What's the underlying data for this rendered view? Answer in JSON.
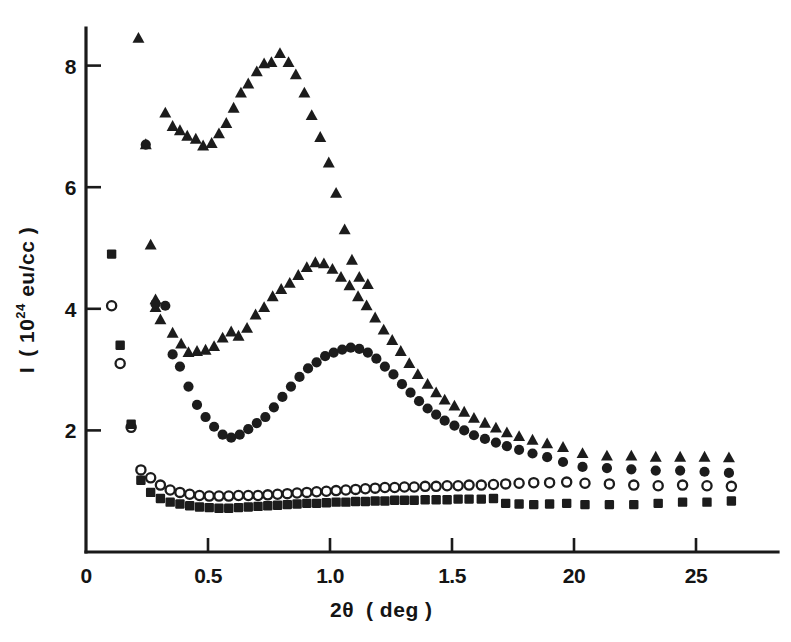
{
  "figure": {
    "background_color": "#ffffff",
    "ink_color": "#1c1c1c",
    "width": 791,
    "height": 642
  },
  "axes": {
    "x_title_main": "2",
    "x_title_theta": "θ",
    "x_title_unit": "( deg )",
    "y_title_symbol": "I",
    "y_title_open": "( 10",
    "y_title_exponent": "24",
    "y_title_rest": " eu/cc )",
    "x_ticks": [
      "0",
      "0.5",
      "1.0",
      "1.5",
      "20",
      "25"
    ],
    "x_tick_values": [
      0,
      0.5,
      1.0,
      1.5,
      2.0,
      2.5
    ],
    "y_ticks": [
      "2",
      "4",
      "6",
      "8"
    ],
    "y_tick_values": [
      2,
      4,
      6,
      8
    ]
  },
  "chart_data": {
    "type": "scatter",
    "title": "",
    "xlabel": "2θ ( deg )",
    "ylabel": "I ( 10^24 eu/cc )",
    "xlim": [
      0,
      2.75
    ],
    "ylim": [
      0,
      8.8
    ],
    "grid": false,
    "legend": "none",
    "x_tick_labels": [
      "0",
      "0.5",
      "1.0",
      "1.5",
      "20",
      "25"
    ],
    "y_tick_labels": [
      "2",
      "4",
      "6",
      "8"
    ],
    "series": [
      {
        "name": "triangle-series",
        "marker": "filled-triangle",
        "color": "#1c1c1c",
        "points": [
          [
            0.215,
            8.45
          ],
          [
            0.245,
            6.7
          ],
          [
            0.265,
            5.05
          ],
          [
            0.285,
            4.15
          ],
          [
            0.285,
            4.02
          ],
          [
            0.305,
            3.82
          ],
          [
            0.325,
            7.22
          ],
          [
            0.355,
            7.0
          ],
          [
            0.385,
            6.93
          ],
          [
            0.415,
            6.84
          ],
          [
            0.45,
            6.79
          ],
          [
            0.48,
            6.68
          ],
          [
            0.515,
            6.72
          ],
          [
            0.545,
            6.88
          ],
          [
            0.575,
            7.05
          ],
          [
            0.605,
            7.3
          ],
          [
            0.635,
            7.55
          ],
          [
            0.665,
            7.7
          ],
          [
            0.7,
            7.9
          ],
          [
            0.73,
            8.03
          ],
          [
            0.76,
            8.05
          ],
          [
            0.795,
            8.2
          ],
          [
            0.83,
            8.05
          ],
          [
            0.86,
            7.85
          ],
          [
            0.895,
            7.55
          ],
          [
            0.925,
            7.18
          ],
          [
            0.96,
            6.82
          ],
          [
            0.995,
            6.4
          ],
          [
            1.025,
            5.9
          ],
          [
            1.06,
            5.3
          ],
          [
            1.09,
            4.8
          ],
          [
            1.12,
            4.52
          ],
          [
            1.155,
            4.4
          ],
          [
            0.355,
            3.6
          ],
          [
            0.39,
            3.42
          ],
          [
            0.42,
            3.28
          ],
          [
            0.455,
            3.3
          ],
          [
            0.49,
            3.32
          ],
          [
            0.525,
            3.38
          ],
          [
            0.56,
            3.52
          ],
          [
            0.595,
            3.62
          ],
          [
            0.625,
            3.55
          ],
          [
            0.66,
            3.68
          ],
          [
            0.695,
            3.9
          ],
          [
            0.73,
            4.02
          ],
          [
            0.765,
            4.2
          ],
          [
            0.8,
            4.32
          ],
          [
            0.835,
            4.42
          ],
          [
            0.87,
            4.55
          ],
          [
            0.905,
            4.68
          ],
          [
            0.94,
            4.76
          ],
          [
            0.975,
            4.74
          ],
          [
            1.01,
            4.65
          ],
          [
            1.045,
            4.52
          ],
          [
            1.08,
            4.38
          ],
          [
            1.115,
            4.2
          ],
          [
            1.15,
            4.05
          ],
          [
            1.185,
            3.85
          ],
          [
            1.22,
            3.65
          ],
          [
            1.255,
            3.48
          ],
          [
            1.29,
            3.3
          ],
          [
            1.325,
            3.1
          ],
          [
            1.36,
            2.92
          ],
          [
            1.4,
            2.76
          ],
          [
            1.435,
            2.62
          ],
          [
            1.47,
            2.5
          ],
          [
            1.51,
            2.4
          ],
          [
            1.55,
            2.3
          ],
          [
            1.59,
            2.2
          ],
          [
            1.635,
            2.12
          ],
          [
            1.68,
            2.04
          ],
          [
            1.725,
            1.96
          ],
          [
            1.775,
            1.9
          ],
          [
            1.83,
            1.84
          ],
          [
            1.89,
            1.78
          ],
          [
            1.955,
            1.72
          ],
          [
            2.035,
            1.62
          ],
          [
            2.135,
            1.58
          ],
          [
            2.235,
            1.58
          ],
          [
            2.335,
            1.56
          ],
          [
            2.435,
            1.56
          ],
          [
            2.535,
            1.56
          ],
          [
            2.635,
            1.55
          ]
        ]
      },
      {
        "name": "filled-circle-series",
        "marker": "filled-circle",
        "color": "#1c1c1c",
        "points": [
          [
            0.245,
            6.7
          ],
          [
            0.285,
            4.08
          ],
          [
            0.325,
            4.05
          ],
          [
            0.355,
            3.25
          ],
          [
            0.385,
            3.05
          ],
          [
            0.42,
            2.72
          ],
          [
            0.455,
            2.42
          ],
          [
            0.49,
            2.22
          ],
          [
            0.525,
            2.06
          ],
          [
            0.56,
            1.93
          ],
          [
            0.595,
            1.88
          ],
          [
            0.63,
            1.93
          ],
          [
            0.665,
            2.02
          ],
          [
            0.7,
            2.12
          ],
          [
            0.735,
            2.22
          ],
          [
            0.77,
            2.38
          ],
          [
            0.805,
            2.55
          ],
          [
            0.84,
            2.72
          ],
          [
            0.875,
            2.88
          ],
          [
            0.91,
            3.02
          ],
          [
            0.945,
            3.12
          ],
          [
            0.98,
            3.22
          ],
          [
            1.015,
            3.28
          ],
          [
            1.05,
            3.33
          ],
          [
            1.085,
            3.36
          ],
          [
            1.12,
            3.34
          ],
          [
            1.155,
            3.28
          ],
          [
            1.19,
            3.18
          ],
          [
            1.225,
            3.05
          ],
          [
            1.26,
            2.92
          ],
          [
            1.295,
            2.76
          ],
          [
            1.33,
            2.62
          ],
          [
            1.365,
            2.48
          ],
          [
            1.4,
            2.36
          ],
          [
            1.435,
            2.26
          ],
          [
            1.47,
            2.16
          ],
          [
            1.51,
            2.08
          ],
          [
            1.55,
            2.0
          ],
          [
            1.59,
            1.92
          ],
          [
            1.635,
            1.86
          ],
          [
            1.68,
            1.8
          ],
          [
            1.725,
            1.74
          ],
          [
            1.775,
            1.68
          ],
          [
            1.83,
            1.62
          ],
          [
            1.89,
            1.56
          ],
          [
            1.955,
            1.48
          ],
          [
            2.035,
            1.4
          ],
          [
            2.135,
            1.38
          ],
          [
            2.235,
            1.36
          ],
          [
            2.335,
            1.34
          ],
          [
            2.435,
            1.34
          ],
          [
            2.535,
            1.32
          ],
          [
            2.635,
            1.3
          ]
        ]
      },
      {
        "name": "open-circle-series",
        "marker": "open-circle",
        "color": "#1c1c1c",
        "points": [
          [
            0.105,
            4.05
          ],
          [
            0.14,
            3.1
          ],
          [
            0.185,
            2.05
          ],
          [
            0.225,
            1.35
          ],
          [
            0.265,
            1.22
          ],
          [
            0.305,
            1.1
          ],
          [
            0.345,
            1.02
          ],
          [
            0.385,
            0.98
          ],
          [
            0.425,
            0.95
          ],
          [
            0.465,
            0.93
          ],
          [
            0.505,
            0.92
          ],
          [
            0.545,
            0.92
          ],
          [
            0.585,
            0.92
          ],
          [
            0.625,
            0.93
          ],
          [
            0.665,
            0.93
          ],
          [
            0.705,
            0.93
          ],
          [
            0.745,
            0.94
          ],
          [
            0.785,
            0.95
          ],
          [
            0.825,
            0.96
          ],
          [
            0.865,
            0.97
          ],
          [
            0.905,
            0.98
          ],
          [
            0.945,
            0.99
          ],
          [
            0.985,
            1.0
          ],
          [
            1.025,
            1.01
          ],
          [
            1.065,
            1.02
          ],
          [
            1.105,
            1.03
          ],
          [
            1.145,
            1.04
          ],
          [
            1.185,
            1.05
          ],
          [
            1.225,
            1.06
          ],
          [
            1.265,
            1.06
          ],
          [
            1.305,
            1.07
          ],
          [
            1.345,
            1.07
          ],
          [
            1.39,
            1.08
          ],
          [
            1.435,
            1.08
          ],
          [
            1.48,
            1.09
          ],
          [
            1.525,
            1.09
          ],
          [
            1.57,
            1.1
          ],
          [
            1.62,
            1.1
          ],
          [
            1.67,
            1.11
          ],
          [
            1.72,
            1.12
          ],
          [
            1.775,
            1.13
          ],
          [
            1.835,
            1.14
          ],
          [
            1.9,
            1.14
          ],
          [
            1.97,
            1.15
          ],
          [
            2.045,
            1.13
          ],
          [
            2.145,
            1.12
          ],
          [
            2.245,
            1.1
          ],
          [
            2.345,
            1.09
          ],
          [
            2.445,
            1.1
          ],
          [
            2.545,
            1.09
          ],
          [
            2.645,
            1.08
          ]
        ]
      },
      {
        "name": "filled-square-series",
        "marker": "filled-square",
        "color": "#1c1c1c",
        "points": [
          [
            0.105,
            4.9
          ],
          [
            0.14,
            3.4
          ],
          [
            0.185,
            2.1
          ],
          [
            0.225,
            1.18
          ],
          [
            0.265,
            0.98
          ],
          [
            0.305,
            0.88
          ],
          [
            0.345,
            0.82
          ],
          [
            0.385,
            0.79
          ],
          [
            0.425,
            0.76
          ],
          [
            0.465,
            0.74
          ],
          [
            0.505,
            0.73
          ],
          [
            0.545,
            0.72
          ],
          [
            0.585,
            0.72
          ],
          [
            0.625,
            0.73
          ],
          [
            0.665,
            0.74
          ],
          [
            0.705,
            0.75
          ],
          [
            0.745,
            0.76
          ],
          [
            0.785,
            0.77
          ],
          [
            0.825,
            0.78
          ],
          [
            0.865,
            0.79
          ],
          [
            0.905,
            0.8
          ],
          [
            0.945,
            0.8
          ],
          [
            0.985,
            0.81
          ],
          [
            1.025,
            0.82
          ],
          [
            1.065,
            0.82
          ],
          [
            1.105,
            0.83
          ],
          [
            1.145,
            0.83
          ],
          [
            1.185,
            0.84
          ],
          [
            1.225,
            0.84
          ],
          [
            1.265,
            0.85
          ],
          [
            1.305,
            0.85
          ],
          [
            1.345,
            0.85
          ],
          [
            1.39,
            0.86
          ],
          [
            1.435,
            0.86
          ],
          [
            1.48,
            0.86
          ],
          [
            1.525,
            0.87
          ],
          [
            1.57,
            0.87
          ],
          [
            1.62,
            0.87
          ],
          [
            1.67,
            0.88
          ],
          [
            1.72,
            0.8
          ],
          [
            1.775,
            0.79
          ],
          [
            1.835,
            0.78
          ],
          [
            1.9,
            0.79
          ],
          [
            1.97,
            0.8
          ],
          [
            2.045,
            0.78
          ],
          [
            2.145,
            0.78
          ],
          [
            2.245,
            0.78
          ],
          [
            2.345,
            0.8
          ],
          [
            2.445,
            0.82
          ],
          [
            2.545,
            0.82
          ],
          [
            2.645,
            0.84
          ]
        ]
      }
    ]
  }
}
